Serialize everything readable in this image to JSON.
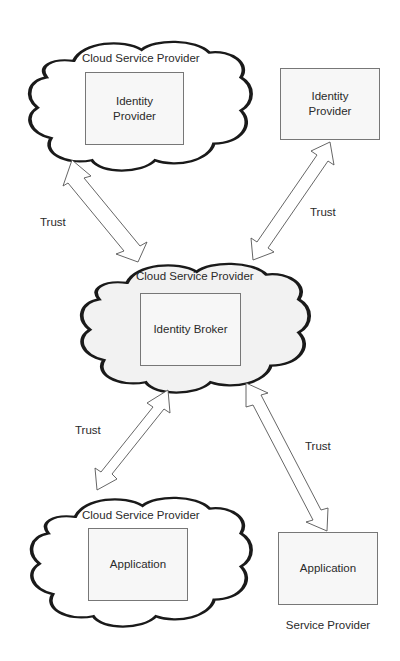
{
  "diagram": {
    "type": "identity-broker-trust-architecture",
    "clouds": [
      {
        "id": "cloud-top",
        "label": "Cloud Service Provider",
        "inner_box": "Identity Provider",
        "fill": "#ffffff"
      },
      {
        "id": "cloud-middle",
        "label": "Cloud Service Provider",
        "inner_box": "Identity Broker",
        "fill": "#f2f2f2"
      },
      {
        "id": "cloud-bottom",
        "label": "Cloud Service Provider",
        "inner_box": "Application",
        "fill": "#ffffff"
      }
    ],
    "standalone_boxes": [
      {
        "id": "box-top-right",
        "label": "Identity Provider"
      },
      {
        "id": "box-bottom-right",
        "label": "Application",
        "caption": "Service Provider"
      }
    ],
    "trust_arrows": [
      {
        "from": "cloud-top",
        "to": "cloud-middle",
        "label": "Trust",
        "bidirectional": true
      },
      {
        "from": "box-top-right",
        "to": "cloud-middle",
        "label": "Trust",
        "bidirectional": true
      },
      {
        "from": "cloud-middle",
        "to": "cloud-bottom",
        "label": "Trust",
        "bidirectional": true
      },
      {
        "from": "cloud-middle",
        "to": "box-bottom-right",
        "label": "Trust",
        "bidirectional": true
      }
    ],
    "labels": {
      "cloud_top_title": "Cloud Service Provider",
      "cloud_top_box_line1": "Identity",
      "cloud_top_box_line2": "Provider",
      "right_top_box_line1": "Identity",
      "right_top_box_line2": "Provider",
      "cloud_mid_title": "Cloud Service Provider",
      "cloud_mid_box": "Identity Broker",
      "cloud_bot_title": "Cloud Service Provider",
      "cloud_bot_box": "Application",
      "right_bot_box": "Application",
      "right_bot_caption": "Service Provider",
      "trust_1": "Trust",
      "trust_2": "Trust",
      "trust_3": "Trust",
      "trust_4": "Trust"
    },
    "colors": {
      "outline": "#1a1a1a",
      "box_border": "#777777",
      "arrow_stroke": "#555555",
      "text": "#2a2a2a",
      "middle_cloud_fill": "#f2f2f2"
    }
  }
}
